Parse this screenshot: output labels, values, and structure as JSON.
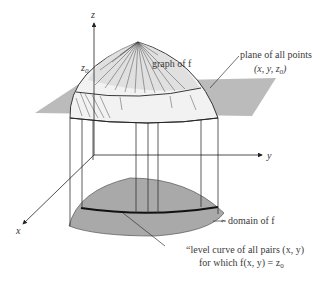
{
  "figure": {
    "axes": {
      "z_label": "z",
      "y_label": "y",
      "x_label": "x"
    },
    "z0_label": "z",
    "z0_sub": "0",
    "annotations": {
      "graph": "graph of f",
      "plane_line1": "plane of all points",
      "plane_line2": "(x, y, z",
      "plane_line2_sub": "0",
      "plane_line2_end": ")",
      "domain": "domain of f",
      "level_line1": "“level curve of all pairs (x, y)",
      "level_line2": "for which f(x, y) = z",
      "level_line2_sub": "0"
    },
    "colors": {
      "plane": "#b4b4b4",
      "domain": "#a9a9a9",
      "lines": "#2a2a2a",
      "text": "#3a3a3a"
    }
  }
}
